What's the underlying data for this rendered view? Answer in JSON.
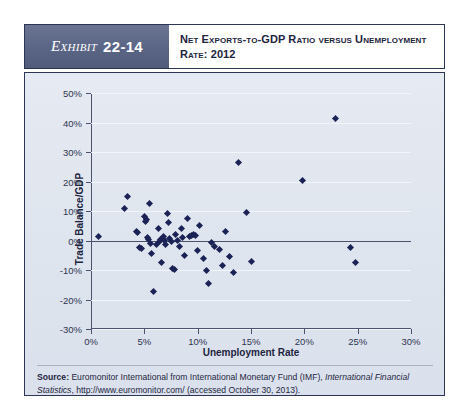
{
  "header": {
    "exhibit_word": "Exhibit",
    "exhibit_number": "22-14",
    "title": "Net Exports-to-GDP Ratio versus Unemployment Rate: 2012"
  },
  "source": {
    "label": "Source:",
    "text_1": " Euromonitor International from International Monetary Fund (IMF), ",
    "italic_1": "International Financial Statistics",
    "text_2": ", http://www.euromonitor.com/ (accessed October 30, 2013)."
  },
  "colors": {
    "marker": "#1b2356",
    "panel_bg": "#e3e8f0",
    "frame": "#2c3554",
    "tag_bg": "#5a6585",
    "zero_line": "#4a5270"
  },
  "chart_data": {
    "type": "scatter",
    "title": "Net Exports-to-GDP Ratio versus Unemployment Rate: 2012",
    "xlabel": "Unemployment Rate",
    "ylabel": "Trade Balance/GDP",
    "xlim": [
      0,
      30
    ],
    "ylim": [
      -30,
      50
    ],
    "xticks": [
      0,
      5,
      10,
      15,
      20,
      25,
      30
    ],
    "xticklabels": [
      "0%",
      "5%",
      "10%",
      "15%",
      "20%",
      "25%",
      "30%"
    ],
    "yticks": [
      -30,
      -20,
      -10,
      0,
      10,
      20,
      30,
      40,
      50
    ],
    "yticklabels": [
      "-30%",
      "-20%",
      "-10%",
      "0%",
      "10%",
      "20%",
      "30%",
      "40%",
      "50%"
    ],
    "grid": true,
    "legend": null,
    "zero_reference_line": 0,
    "units": "percent",
    "n_points": 59,
    "points": [
      {
        "x": 0.7,
        "y": 1.5
      },
      {
        "x": 3.1,
        "y": 11.0
      },
      {
        "x": 3.4,
        "y": 15.0
      },
      {
        "x": 4.3,
        "y": 3.2
      },
      {
        "x": 4.4,
        "y": 2.6
      },
      {
        "x": 4.5,
        "y": -2.5
      },
      {
        "x": 4.7,
        "y": -2.8
      },
      {
        "x": 5.0,
        "y": 8.0
      },
      {
        "x": 5.1,
        "y": 6.5
      },
      {
        "x": 5.2,
        "y": 7.2
      },
      {
        "x": 5.3,
        "y": 1.0
      },
      {
        "x": 5.4,
        "y": 0.2
      },
      {
        "x": 5.5,
        "y": 12.5
      },
      {
        "x": 5.6,
        "y": -1.0
      },
      {
        "x": 5.7,
        "y": -4.5
      },
      {
        "x": 5.9,
        "y": -17.3
      },
      {
        "x": 6.1,
        "y": -1.5
      },
      {
        "x": 6.3,
        "y": 4.0
      },
      {
        "x": 6.4,
        "y": -0.5
      },
      {
        "x": 6.5,
        "y": 0.5
      },
      {
        "x": 6.6,
        "y": -7.5
      },
      {
        "x": 6.8,
        "y": 1.2
      },
      {
        "x": 6.9,
        "y": 0.0
      },
      {
        "x": 7.0,
        "y": -1.2
      },
      {
        "x": 7.2,
        "y": 9.0
      },
      {
        "x": 7.3,
        "y": 6.0
      },
      {
        "x": 7.4,
        "y": 0.8
      },
      {
        "x": 7.5,
        "y": -0.3
      },
      {
        "x": 7.6,
        "y": -9.5
      },
      {
        "x": 7.8,
        "y": -9.8
      },
      {
        "x": 7.9,
        "y": 2.0
      },
      {
        "x": 8.1,
        "y": 0.0
      },
      {
        "x": 8.3,
        "y": -2.0
      },
      {
        "x": 8.5,
        "y": 4.0
      },
      {
        "x": 8.6,
        "y": 1.0
      },
      {
        "x": 8.8,
        "y": -5.0
      },
      {
        "x": 9.0,
        "y": 7.5
      },
      {
        "x": 9.2,
        "y": 1.5
      },
      {
        "x": 9.4,
        "y": 1.8
      },
      {
        "x": 9.6,
        "y": 2.0
      },
      {
        "x": 9.8,
        "y": 1.6
      },
      {
        "x": 10.0,
        "y": -3.5
      },
      {
        "x": 10.2,
        "y": 5.0
      },
      {
        "x": 10.5,
        "y": -6.0
      },
      {
        "x": 10.8,
        "y": -10.0
      },
      {
        "x": 11.0,
        "y": -14.5
      },
      {
        "x": 11.3,
        "y": -0.8
      },
      {
        "x": 11.6,
        "y": -2.0
      },
      {
        "x": 12.0,
        "y": -3.0
      },
      {
        "x": 12.3,
        "y": -8.5
      },
      {
        "x": 12.6,
        "y": 3.0
      },
      {
        "x": 13.0,
        "y": -5.5
      },
      {
        "x": 13.4,
        "y": -11.0
      },
      {
        "x": 13.8,
        "y": 26.5
      },
      {
        "x": 14.6,
        "y": 9.5
      },
      {
        "x": 15.0,
        "y": -7.0
      },
      {
        "x": 19.8,
        "y": 20.5
      },
      {
        "x": 22.9,
        "y": 41.5
      },
      {
        "x": 24.3,
        "y": -2.5
      },
      {
        "x": 24.8,
        "y": -7.5
      }
    ]
  }
}
